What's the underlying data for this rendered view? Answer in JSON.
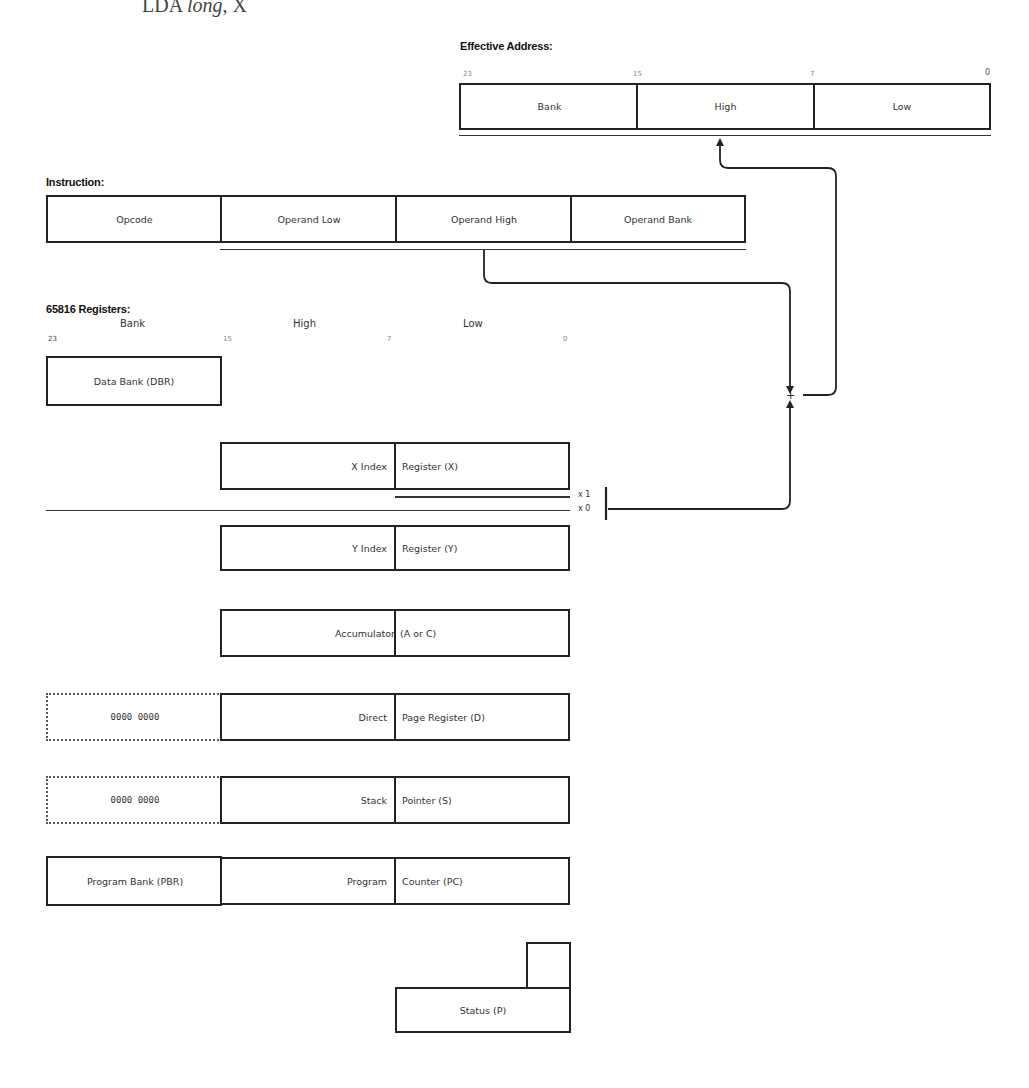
{
  "title": {
    "prefix": "LDA ",
    "italic": "long",
    "suffix": ", X"
  },
  "effective_address": {
    "heading": "Effective Address:",
    "bit_labels": [
      "23",
      "15",
      "7",
      "0"
    ],
    "cells": [
      "Bank",
      "High",
      "Low"
    ]
  },
  "instruction": {
    "heading": "Instruction:",
    "cells": [
      "Opcode",
      "Operand Low",
      "Operand High",
      "Operand Bank"
    ]
  },
  "registers": {
    "heading": "65816 Registers:",
    "columns": [
      "Bank",
      "High",
      "Low"
    ],
    "bit_labels": [
      "23",
      "15",
      "7",
      "0"
    ],
    "data_bank": "Data Bank (DBR)",
    "x_index": {
      "left": "X Index",
      "right": "Register (X)"
    },
    "x_flags": {
      "x1": "x  1",
      "x0": "x  0"
    },
    "y_index": {
      "left": "Y Index",
      "right": "Register (Y)"
    },
    "accumulator": {
      "left": "Accumulator",
      "right": "(A or C)"
    },
    "direct_page": {
      "bank": "0000 0000",
      "left": "Direct",
      "right": "Page Register (D)"
    },
    "stack": {
      "bank": "0000 0000",
      "left": "Stack",
      "right": "Pointer (S)"
    },
    "program": {
      "bank": "Program Bank (PBR)",
      "left": "Program",
      "right": "Counter (PC)"
    },
    "status": "Status (P)"
  },
  "adder_symbol": "+"
}
